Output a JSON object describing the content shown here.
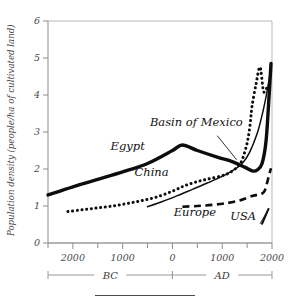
{
  "chart_data": {
    "type": "line",
    "title": "",
    "subtitle": "",
    "xlabel": "",
    "ylabel": "Population density (people/ha of cultivated land)",
    "ylim": [
      0,
      6
    ],
    "xlim": [
      -2500,
      2000
    ],
    "grid": false,
    "legend_position": "inline-labels",
    "y_ticks": [
      "0",
      "1",
      "2",
      "3",
      "4",
      "5",
      "6"
    ],
    "y_tick_values": [
      0,
      1,
      2,
      3,
      4,
      5,
      6
    ],
    "x_ticks": [
      "2000",
      "1000",
      "0",
      "1000",
      "2000"
    ],
    "x_tick_values": [
      -2000,
      -1000,
      0,
      1000,
      2000
    ],
    "x_minor_tick_values": [
      -2500,
      -1500,
      -500,
      500,
      1500
    ],
    "era_axis": {
      "bc_label": "BC",
      "ad_label": "AD",
      "bc_range": [
        -2500,
        0
      ],
      "ad_range": [
        0,
        2000
      ]
    },
    "series": [
      {
        "name": "Egypt",
        "style": "thick-solid",
        "label": "Egypt",
        "label_x": -900,
        "label_y": 2.52,
        "x": [
          -2500,
          -2000,
          -1500,
          -1000,
          -500,
          0,
          200,
          500,
          900,
          1200,
          1450,
          1600,
          1700,
          1800,
          1880,
          1940,
          1980
        ],
        "y": [
          1.3,
          1.52,
          1.72,
          1.92,
          2.15,
          2.5,
          2.65,
          2.5,
          2.32,
          2.2,
          2.05,
          1.95,
          1.97,
          2.15,
          2.75,
          3.95,
          4.85
        ]
      },
      {
        "name": "Basin of Mexico",
        "style": "dotted",
        "label": "Basin of Mexico",
        "label_x": 480,
        "label_y": 3.15,
        "x": [
          -2100,
          -1800,
          -1500,
          -1200,
          -900,
          -600,
          -300,
          0,
          250,
          500,
          750,
          1000,
          1150,
          1300,
          1400,
          1500,
          1560,
          1600,
          1680,
          1760,
          1830,
          1900
        ],
        "y": [
          0.85,
          0.9,
          0.95,
          1.0,
          1.07,
          1.15,
          1.25,
          1.4,
          1.55,
          1.66,
          1.74,
          1.82,
          1.9,
          2.05,
          2.25,
          2.7,
          3.2,
          3.7,
          4.3,
          4.75,
          4.1,
          4.2
        ]
      },
      {
        "name": "China",
        "style": "thin-solid",
        "label": "China",
        "label_x": -420,
        "label_y": 1.8,
        "x": [
          -500,
          -200,
          100,
          400,
          700,
          1000,
          1200,
          1400,
          1550,
          1700,
          1800,
          1880,
          1940,
          1980
        ],
        "y": [
          0.98,
          1.12,
          1.28,
          1.45,
          1.62,
          1.8,
          1.95,
          2.15,
          2.45,
          2.95,
          3.45,
          3.95,
          4.4,
          4.75
        ]
      },
      {
        "name": "Europe",
        "style": "dashed",
        "label": "Europe",
        "label_x": 450,
        "label_y": 0.72,
        "x": [
          200,
          500,
          800,
          1100,
          1350,
          1500,
          1600,
          1700,
          1780,
          1850,
          1900,
          1950,
          1980
        ],
        "y": [
          0.98,
          1.0,
          1.03,
          1.08,
          1.15,
          1.22,
          1.27,
          1.3,
          1.32,
          1.4,
          1.62,
          1.88,
          2.02
        ]
      },
      {
        "name": "USA",
        "style": "short-solid",
        "label": "USA",
        "label_x": 1420,
        "label_y": 0.62,
        "x": [
          1800,
          1930
        ],
        "y": [
          0.52,
          0.92
        ]
      }
    ],
    "annotations": [
      {
        "text": "Basin of Mexico",
        "leader_from_x": 900,
        "leader_from_y": 2.9,
        "leader_to_x": 1290,
        "leader_to_y": 2.25
      },
      {
        "text": "USA",
        "leader_from_x": 1760,
        "leader_from_y": 0.52,
        "leader_to_x": 1930,
        "leader_to_y": 0.92
      }
    ]
  }
}
